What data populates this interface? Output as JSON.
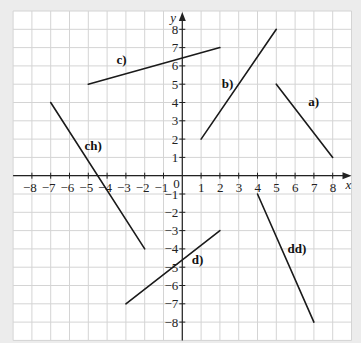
{
  "chart_data": {
    "type": "line",
    "title": "",
    "xlabel": "x",
    "ylabel": "y",
    "xlim": [
      -9,
      9
    ],
    "ylim": [
      -9,
      9
    ],
    "grid": true,
    "x_ticks": [
      -8,
      -7,
      -6,
      -5,
      -4,
      -3,
      -2,
      -1,
      0,
      1,
      2,
      3,
      4,
      5,
      6,
      7,
      8
    ],
    "y_ticks": [
      -8,
      -7,
      -6,
      -5,
      -4,
      -3,
      -2,
      -1,
      1,
      2,
      3,
      4,
      5,
      6,
      7,
      8
    ],
    "origin_label": "0",
    "series": [
      {
        "name": "a)",
        "points": [
          [
            5,
            5
          ],
          [
            8,
            1
          ]
        ],
        "label_at": [
          6.7,
          3.8
        ]
      },
      {
        "name": "b)",
        "points": [
          [
            1,
            2
          ],
          [
            5,
            8
          ]
        ],
        "label_at": [
          2.1,
          4.8
        ]
      },
      {
        "name": "c)",
        "points": [
          [
            -5,
            5
          ],
          [
            2,
            7
          ]
        ],
        "label_at": [
          -3.5,
          6.1
        ]
      },
      {
        "name": "ch)",
        "points": [
          [
            -7,
            4
          ],
          [
            -2,
            -4
          ]
        ],
        "label_at": [
          -5.2,
          1.4
        ]
      },
      {
        "name": "d)",
        "points": [
          [
            -3,
            -7
          ],
          [
            2,
            -3
          ]
        ],
        "label_at": [
          0.5,
          -4.8
        ]
      },
      {
        "name": "dd)",
        "points": [
          [
            4,
            -1
          ],
          [
            7,
            -8
          ]
        ],
        "label_at": [
          5.6,
          -4.2
        ]
      }
    ]
  },
  "colors": {
    "background": "#ececec",
    "plot_area": "#ffffff",
    "grid": "#d4d4d4",
    "axis": "#222222",
    "segment": "#1a1a1a"
  }
}
